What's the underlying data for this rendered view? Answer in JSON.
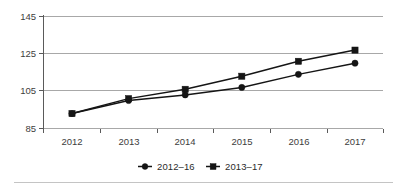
{
  "chart_data": {
    "type": "line",
    "title": "",
    "subtitle": "",
    "xlabel": "",
    "ylabel": "",
    "categories": [
      "2012",
      "2013",
      "2014",
      "2015",
      "2016",
      "2017"
    ],
    "x": [
      2012,
      2013,
      2014,
      2015,
      2016,
      2017
    ],
    "yticks": [
      85,
      105,
      125,
      145
    ],
    "ytick_labels": [
      "85",
      "105",
      "125",
      "145"
    ],
    "ylim": [
      85,
      145
    ],
    "grid": true,
    "legend_position": "bottom-center",
    "series": [
      {
        "name": "2012–16",
        "marker": "circle",
        "values": [
          93,
          100,
          103,
          107,
          114,
          120
        ]
      },
      {
        "name": "2013–17",
        "marker": "square",
        "values": [
          93,
          101,
          106,
          113,
          121,
          127
        ]
      }
    ],
    "annotations": []
  },
  "legend": {
    "items": [
      {
        "label": "2012–16",
        "marker": "circle"
      },
      {
        "label": "2013–17",
        "marker": "square"
      }
    ]
  },
  "axes": {
    "y_tick_labels": [
      "145",
      "125",
      "105",
      "85"
    ],
    "x_tick_labels": [
      "2012",
      "2013",
      "2014",
      "2015",
      "2016",
      "2017"
    ]
  },
  "colors": {
    "series": "#151515",
    "gridline": "#a8a8a8",
    "axis": "#5a5a5a",
    "tick_text": "#3d3d3d",
    "legend_text": "#2b2b2b",
    "footer_rule": "#c4c4c4",
    "background": "#ffffff"
  }
}
